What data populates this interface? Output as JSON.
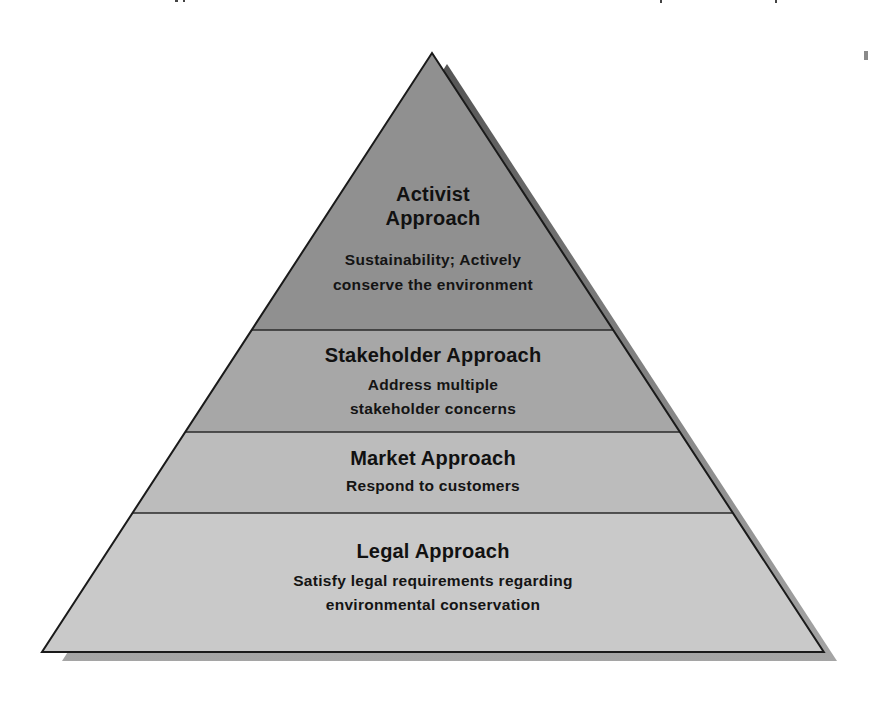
{
  "diagram": {
    "type": "pyramid",
    "colors": {
      "shadow_top": "#5a5a5a",
      "shadow_bottom": "#a3a3a3",
      "outline": "#1a1a1a",
      "text": "#111111",
      "tier_activist": "#909090",
      "tier_stakeholder": "#a7a7a7",
      "tier_market": "#bcbcbc",
      "tier_legal": "#c9c9c9"
    },
    "tiers": [
      {
        "level": 4,
        "title_lines": [
          "Activist",
          "Approach"
        ],
        "description_lines": [
          "Sustainability; Actively",
          "conserve the environment"
        ]
      },
      {
        "level": 3,
        "title_lines": [
          "Stakeholder Approach"
        ],
        "description_lines": [
          "Address multiple",
          "stakeholder concerns"
        ]
      },
      {
        "level": 2,
        "title_lines": [
          "Market Approach"
        ],
        "description_lines": [
          "Respond to customers"
        ]
      },
      {
        "level": 1,
        "title_lines": [
          "Legal Approach"
        ],
        "description_lines": [
          "Satisfy legal requirements regarding",
          "environmental conservation"
        ]
      }
    ]
  }
}
